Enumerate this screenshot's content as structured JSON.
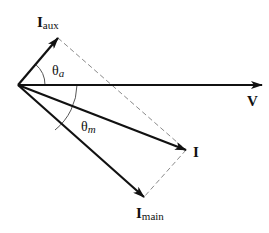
{
  "diagram": {
    "type": "phasor-diagram",
    "colors": {
      "vector": "#111111",
      "dashed": "#8a8a8a",
      "arc": "#555555",
      "background": "#ffffff"
    },
    "origin": [
      18,
      85
    ],
    "vectors": [
      {
        "id": "V",
        "tip": [
          262,
          85
        ],
        "label": "V",
        "label_sub": "",
        "label_pos": [
          247,
          105
        ]
      },
      {
        "id": "I_aux",
        "tip": [
          58,
          38
        ],
        "label": "I",
        "label_sub": "aux",
        "label_pos": [
          37,
          26
        ]
      },
      {
        "id": "I",
        "tip": [
          186,
          150
        ],
        "label": "I",
        "label_sub": "",
        "label_pos": [
          193,
          157
        ]
      },
      {
        "id": "I_main",
        "tip": [
          144,
          197
        ],
        "label": "I",
        "label_sub": "main",
        "label_pos": [
          136,
          218
        ]
      }
    ],
    "angles": [
      {
        "id": "theta_a",
        "symbol": "θ",
        "sub": "a",
        "label_pos": [
          52,
          75
        ]
      },
      {
        "id": "theta_m",
        "symbol": "θ",
        "sub": "m",
        "label_pos": [
          81,
          131
        ]
      }
    ],
    "dashed_lines": [
      {
        "from": [
          58,
          38
        ],
        "to": [
          186,
          150
        ]
      },
      {
        "from": [
          186,
          150
        ],
        "to": [
          144,
          197
        ]
      }
    ]
  }
}
